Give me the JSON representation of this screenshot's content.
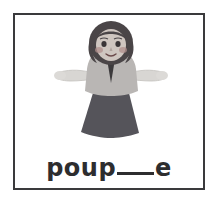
{
  "card": {
    "border_color": "#3a3a3c",
    "background": "#ffffff"
  },
  "illustration": {
    "name": "doll-puppet-illustration",
    "description": "poupée",
    "colors": {
      "hair": "#4a4547",
      "skin": "#cfc6c0",
      "cheek": "#b08f8c",
      "blouse": "#b9b6b4",
      "arms": "#d8d6d3",
      "skirt": "#55545a",
      "scarf": "#3c3a3c",
      "outline": "#4a4547"
    }
  },
  "word": {
    "prefix": "poup",
    "blank": "___",
    "suffix": "e",
    "full_text": "poup___e",
    "answer_hint": "ée"
  }
}
